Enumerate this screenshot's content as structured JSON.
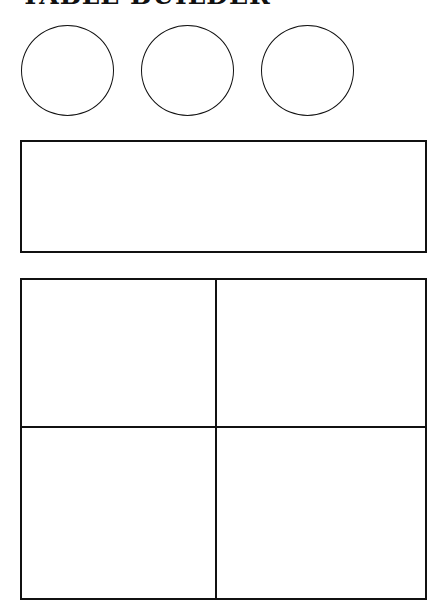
{
  "page": {
    "title": "TABLE BUILDER"
  },
  "circles": [
    {
      "label": ""
    },
    {
      "label": ""
    },
    {
      "label": ""
    }
  ],
  "banner_box": {
    "text": ""
  },
  "grid": {
    "rows": 2,
    "columns": 2,
    "cells": [
      "",
      "",
      "",
      ""
    ]
  },
  "colors": {
    "line": "#111111",
    "background": "#ffffff"
  }
}
